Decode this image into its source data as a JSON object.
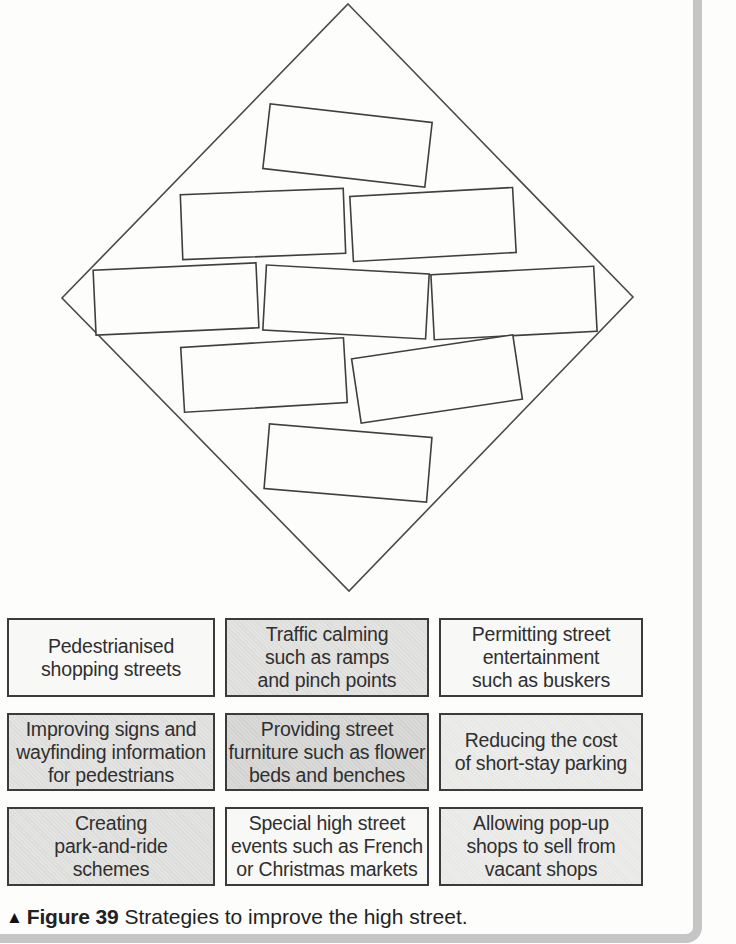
{
  "figure": {
    "marker": "▲",
    "label": "Figure 39",
    "caption": "Strategies to improve the high street."
  },
  "diamond_activity": {
    "description": "empty diamond-nine ranking template",
    "slots": 9,
    "rows_pattern": "1-2-3-2-1"
  },
  "strategies": [
    {
      "text": "Pedestrianised\nshopping streets",
      "tone": "white"
    },
    {
      "text": "Traffic calming\nsuch as ramps\nand pinch points",
      "tone": "light"
    },
    {
      "text": "Permitting street\nentertainment\nsuch as buskers",
      "tone": "white"
    },
    {
      "text": "Improving signs and\nwayfinding information\nfor pedestrians",
      "tone": "light"
    },
    {
      "text": "Providing street\nfurniture such as flower\nbeds and benches",
      "tone": "medium"
    },
    {
      "text": "Reducing the cost\nof short-stay parking",
      "tone": "xlight"
    },
    {
      "text": "Creating\npark-and-ride\nschemes",
      "tone": "light"
    },
    {
      "text": "Special high street\nevents such as French\nor Christmas markets",
      "tone": "white"
    },
    {
      "text": "Allowing pop-up\nshops to sell from\nvacant shops",
      "tone": "xlight"
    }
  ],
  "colors": {
    "page_bg": "#fdfdfc",
    "line": "#4a4a4a",
    "box_border": "#3b3b3b",
    "text": "#2f2f2f",
    "page_bar": "#c5c5c5",
    "tone_white": "#f8f8f6",
    "tone_xlight": "#ececea",
    "tone_light": "#e3e3e1",
    "tone_medium": "#d9d9d7"
  }
}
